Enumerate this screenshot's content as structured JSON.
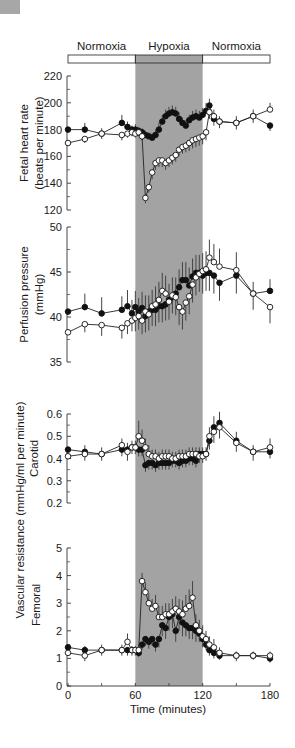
{
  "chart_data": {
    "type": "line",
    "x_label": "Time (minutes)",
    "x_ticks": [
      0,
      60,
      120,
      180
    ],
    "x_minor_ticks": [
      30,
      90,
      150
    ],
    "xlim": [
      0,
      180
    ],
    "phases": [
      {
        "label": "Normoxia",
        "start": 0,
        "end": 60,
        "shaded": false
      },
      {
        "label": "Hypoxia",
        "start": 60,
        "end": 120,
        "shaded": true
      },
      {
        "label": "Normoxia",
        "start": 120,
        "end": 180,
        "shaded": false
      }
    ],
    "shade_color": "#a3a3a3",
    "series_legend": [
      {
        "name": "filled",
        "marker": "filled-circle",
        "color": "#111111"
      },
      {
        "name": "open",
        "marker": "open-circle",
        "color": "#111111"
      }
    ],
    "panels": [
      {
        "id": "fhr",
        "ylabel_lines": [
          "Fetal heart rate",
          "(beats per minute)"
        ],
        "ylim": [
          120,
          220
        ],
        "yticks": [
          120,
          140,
          160,
          180,
          200,
          220
        ],
        "ytick_labels": [
          "120",
          "140",
          "160",
          "180",
          "200",
          "220"
        ],
        "series": [
          {
            "name": "filled",
            "x": [
              0,
              15,
              30,
              48,
              53,
              57,
              60,
              63,
              66,
              69,
              72,
              75,
              78,
              81,
              84,
              87,
              90,
              93,
              96,
              99,
              102,
              105,
              108,
              111,
              114,
              117,
              120,
              123,
              126,
              130,
              135,
              150,
              165,
              180
            ],
            "y": [
              180,
              180,
              177,
              185,
              182,
              180,
              180,
              179,
              178,
              176,
              175,
              174,
              176,
              180,
              186,
              190,
              192,
              193,
              192,
              188,
              185,
              183,
              187,
              189,
              190,
              189,
              191,
              194,
              198,
              188,
              186,
              185,
              190,
              183
            ],
            "err": [
              0,
              5,
              4,
              6,
              4,
              3,
              4,
              3,
              3,
              3,
              3,
              3,
              4,
              5,
              5,
              5,
              5,
              5,
              5,
              5,
              4,
              4,
              4,
              5,
              5,
              5,
              5,
              6,
              5,
              5,
              4,
              5,
              5,
              4
            ]
          },
          {
            "name": "open",
            "x": [
              0,
              15,
              30,
              48,
              53,
              57,
              60,
              63,
              66,
              69,
              72,
              75,
              78,
              81,
              84,
              87,
              90,
              93,
              96,
              99,
              102,
              105,
              108,
              111,
              114,
              117,
              120,
              123,
              126,
              130,
              135,
              150,
              165,
              180
            ],
            "y": [
              170,
              173,
              177,
              176,
              177,
              178,
              177,
              178,
              175,
              129,
              137,
              148,
              155,
              157,
              157,
              155,
              157,
              159,
              161,
              165,
              167,
              168,
              170,
              172,
              173,
              174,
              175,
              178,
              193,
              190,
              186,
              185,
              190,
              195
            ],
            "err": [
              0,
              3,
              4,
              4,
              3,
              3,
              3,
              3,
              3,
              4,
              4,
              5,
              5,
              5,
              5,
              5,
              5,
              5,
              5,
              5,
              5,
              5,
              6,
              6,
              6,
              6,
              6,
              6,
              5,
              5,
              5,
              5,
              5,
              5
            ]
          }
        ]
      },
      {
        "id": "perfusion",
        "ylabel_lines": [
          "Perfusion pressure",
          "(mmHg)"
        ],
        "ylim": [
          35,
          50
        ],
        "yticks": [
          35,
          40,
          45,
          50
        ],
        "ytick_labels": [
          "35",
          "40",
          "45",
          "50"
        ],
        "series": [
          {
            "name": "filled",
            "x": [
              0,
              15,
              30,
              48,
              53,
              57,
              60,
              63,
              66,
              69,
              72,
              75,
              78,
              81,
              84,
              87,
              90,
              93,
              96,
              99,
              102,
              105,
              108,
              111,
              114,
              117,
              120,
              123,
              126,
              130,
              135,
              150,
              165,
              180
            ],
            "y": [
              40.6,
              41.1,
              40.4,
              40.8,
              41.2,
              40.4,
              41.1,
              40.6,
              41,
              40.1,
              40.6,
              40.8,
              40.8,
              41.2,
              41.2,
              41.4,
              41.9,
              42.2,
              42.6,
              43.3,
              44.1,
              44.1,
              43.5,
              44.5,
              44.9,
              44.9,
              44.6,
              44.9,
              44.9,
              44.6,
              43.8,
              44.6,
              42.6,
              42.9
            ],
            "err": [
              0,
              1.5,
              1.8,
              1.5,
              1.8,
              1.5,
              1.8,
              1.5,
              1.8,
              1.8,
              1.8,
              1.8,
              1.8,
              1.8,
              1.8,
              1.8,
              1.8,
              1.8,
              1.8,
              2,
              2,
              2,
              2,
              2,
              2,
              2,
              2,
              2,
              2,
              2,
              2,
              2,
              1.3,
              1.3
            ]
          },
          {
            "name": "open",
            "x": [
              0,
              15,
              30,
              48,
              53,
              57,
              60,
              63,
              66,
              69,
              72,
              75,
              78,
              81,
              84,
              87,
              90,
              93,
              96,
              99,
              102,
              105,
              108,
              111,
              114,
              117,
              120,
              123,
              126,
              130,
              135,
              150,
              165,
              180
            ],
            "y": [
              38.3,
              39.2,
              39.1,
              38.8,
              39.3,
              39.6,
              39.9,
              40.1,
              39.6,
              40.6,
              40.3,
              41.2,
              41.4,
              41.9,
              42.9,
              42.6,
              41.7,
              42.4,
              42.2,
              41.1,
              40.6,
              41.6,
              42.3,
              43.6,
              44.4,
              44.8,
              45.1,
              45.3,
              46.6,
              46.1,
              45.6,
              45.2,
              42.6,
              41.1
            ],
            "err": [
              0,
              0.9,
              1.2,
              1.2,
              1.2,
              1.2,
              1.5,
              1.5,
              1.5,
              1.8,
              1.8,
              1.8,
              2,
              2,
              2,
              2,
              2,
              2,
              2,
              2,
              2,
              2,
              2,
              2,
              2,
              2,
              2,
              2,
              2,
              2,
              2,
              2,
              1.8,
              1.8
            ]
          }
        ]
      },
      {
        "id": "carotid",
        "ylabel_lines": [
          "Carotid"
        ],
        "ylim": [
          0.2,
          0.6
        ],
        "yticks": [
          0.2,
          0.3,
          0.4,
          0.5,
          0.6
        ],
        "ytick_labels": [
          "0.2",
          "0.3",
          "0.4",
          "0.5",
          "0.6"
        ],
        "series": [
          {
            "name": "filled",
            "x": [
              0,
              15,
              30,
              48,
              53,
              57,
              60,
              63,
              66,
              69,
              72,
              75,
              78,
              81,
              84,
              87,
              90,
              93,
              96,
              99,
              102,
              105,
              108,
              111,
              114,
              117,
              120,
              123,
              126,
              130,
              135,
              150,
              165,
              180
            ],
            "y": [
              0.44,
              0.43,
              0.42,
              0.44,
              0.44,
              0.45,
              0.45,
              0.44,
              0.44,
              0.37,
              0.38,
              0.38,
              0.37,
              0.38,
              0.38,
              0.38,
              0.38,
              0.39,
              0.39,
              0.38,
              0.39,
              0.39,
              0.4,
              0.4,
              0.39,
              0.42,
              0.42,
              0.42,
              0.48,
              0.54,
              0.56,
              0.48,
              0.43,
              0.43
            ],
            "err": [
              0,
              0.03,
              0.03,
              0.03,
              0.03,
              0.03,
              0.03,
              0.03,
              0.03,
              0.03,
              0.03,
              0.03,
              0.03,
              0.03,
              0.03,
              0.03,
              0.03,
              0.03,
              0.03,
              0.03,
              0.03,
              0.03,
              0.03,
              0.03,
              0.03,
              0.03,
              0.03,
              0.03,
              0.04,
              0.05,
              0.05,
              0.04,
              0.03,
              0.03
            ]
          },
          {
            "name": "open",
            "x": [
              0,
              15,
              30,
              48,
              53,
              57,
              60,
              63,
              66,
              69,
              72,
              75,
              78,
              81,
              84,
              87,
              90,
              93,
              96,
              99,
              102,
              105,
              108,
              111,
              114,
              117,
              120,
              123,
              126,
              130,
              135,
              150,
              165,
              180
            ],
            "y": [
              0.41,
              0.42,
              0.42,
              0.46,
              0.43,
              0.45,
              0.45,
              0.5,
              0.48,
              0.45,
              0.42,
              0.41,
              0.41,
              0.4,
              0.41,
              0.41,
              0.41,
              0.4,
              0.4,
              0.41,
              0.41,
              0.41,
              0.42,
              0.42,
              0.42,
              0.41,
              0.41,
              0.42,
              0.5,
              0.52,
              0.54,
              0.47,
              0.43,
              0.45
            ],
            "err": [
              0,
              0.03,
              0.03,
              0.03,
              0.04,
              0.03,
              0.03,
              0.07,
              0.05,
              0.04,
              0.04,
              0.03,
              0.03,
              0.03,
              0.03,
              0.03,
              0.03,
              0.03,
              0.03,
              0.03,
              0.03,
              0.03,
              0.03,
              0.03,
              0.03,
              0.03,
              0.03,
              0.03,
              0.04,
              0.05,
              0.05,
              0.04,
              0.04,
              0.04
            ]
          }
        ]
      },
      {
        "id": "femoral",
        "ylabel_lines": [
          "Vascular resistance (mmHg/ml per minute)",
          "Femoral"
        ],
        "ylim": [
          0,
          5
        ],
        "yticks": [
          0,
          1,
          2,
          3,
          4,
          5
        ],
        "ytick_labels": [
          "0",
          "1",
          "2",
          "3",
          "4",
          "5"
        ],
        "series": [
          {
            "name": "filled",
            "x": [
              0,
              15,
              30,
              48,
              53,
              57,
              60,
              63,
              66,
              69,
              72,
              75,
              78,
              81,
              84,
              87,
              90,
              93,
              96,
              99,
              102,
              105,
              108,
              111,
              114,
              117,
              120,
              123,
              126,
              130,
              135,
              150,
              165,
              180
            ],
            "y": [
              1.4,
              1.3,
              1.3,
              1.3,
              1.3,
              1.3,
              1.3,
              1.2,
              1.5,
              1.7,
              1.6,
              1.7,
              1.5,
              1.7,
              2.2,
              2.1,
              2.5,
              2.6,
              2.0,
              2.5,
              2.3,
              2.2,
              2.1,
              2.1,
              2.0,
              1.9,
              1.7,
              1.5,
              1.3,
              1.2,
              1.1,
              1.1,
              1.1,
              1.0
            ],
            "err": [
              0,
              0.15,
              0.2,
              0.2,
              0.2,
              0.15,
              0.15,
              0.15,
              0.2,
              0.25,
              0.25,
              0.25,
              0.25,
              0.3,
              0.4,
              0.4,
              0.5,
              0.5,
              0.4,
              0.5,
              0.5,
              0.4,
              0.4,
              0.4,
              0.4,
              0.3,
              0.3,
              0.2,
              0.2,
              0.2,
              0.15,
              0.15,
              0.15,
              0.15
            ]
          },
          {
            "name": "open",
            "x": [
              0,
              15,
              30,
              48,
              53,
              57,
              60,
              63,
              66,
              69,
              72,
              75,
              78,
              81,
              84,
              87,
              90,
              93,
              96,
              99,
              102,
              105,
              108,
              111,
              114,
              117,
              120,
              123,
              126,
              130,
              135,
              150,
              165,
              180
            ],
            "y": [
              1.2,
              1.1,
              1.3,
              1.3,
              1.6,
              1.3,
              1.3,
              1.3,
              3.8,
              3.4,
              3.0,
              2.8,
              2.9,
              2.5,
              2.5,
              2.6,
              2.6,
              2.7,
              2.8,
              2.7,
              2.6,
              2.8,
              2.9,
              3.2,
              2.2,
              2.0,
              1.8,
              1.7,
              1.5,
              1.4,
              1.2,
              1.1,
              1.1,
              1.1
            ],
            "err": [
              0,
              0.2,
              0.2,
              0.2,
              0.3,
              0.2,
              0.2,
              0.2,
              0.3,
              0.35,
              0.35,
              0.35,
              0.4,
              0.4,
              0.4,
              0.4,
              0.4,
              0.45,
              0.45,
              0.45,
              0.5,
              0.5,
              0.6,
              0.6,
              0.4,
              0.4,
              0.4,
              0.3,
              0.3,
              0.3,
              0.2,
              0.2,
              0.15,
              0.15
            ]
          }
        ]
      }
    ]
  }
}
